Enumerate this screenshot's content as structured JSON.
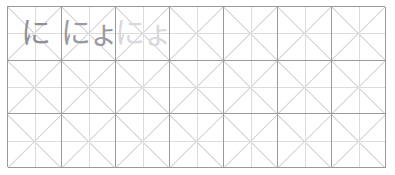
{
  "worksheet": {
    "title": "Japanese hiragana handwriting practice sheet",
    "script_type": "hiragana",
    "grid": {
      "columns": 7,
      "rows": 3,
      "cell_style": "diagonal-cross guide box",
      "border_color": "#9a9a9a",
      "diagonal_color": "#cfcfd4",
      "center_cross_color": "#dcdce0",
      "background_color": "#ffffff"
    },
    "ink_colors": {
      "dark": "#8f8f98",
      "mid": "#9a9aa4",
      "light": "#d8d8de"
    },
    "cells": [
      {
        "row": 1,
        "col": 1,
        "text": "に",
        "ink": "ink-dark",
        "filled": true
      },
      {
        "row": 1,
        "col": 2,
        "text": "にょ",
        "ink": "ink-mid",
        "filled": true
      },
      {
        "row": 1,
        "col": 3,
        "text": "にょ",
        "ink": "ink-light",
        "filled": true
      },
      {
        "row": 1,
        "col": 4,
        "text": "",
        "ink": "empty",
        "filled": false
      },
      {
        "row": 1,
        "col": 5,
        "text": "",
        "ink": "empty",
        "filled": false
      },
      {
        "row": 1,
        "col": 6,
        "text": "",
        "ink": "empty",
        "filled": false
      },
      {
        "row": 1,
        "col": 7,
        "text": "",
        "ink": "empty",
        "filled": false
      },
      {
        "row": 2,
        "col": 1,
        "text": "",
        "ink": "empty",
        "filled": false
      },
      {
        "row": 2,
        "col": 2,
        "text": "",
        "ink": "empty",
        "filled": false
      },
      {
        "row": 2,
        "col": 3,
        "text": "",
        "ink": "empty",
        "filled": false
      },
      {
        "row": 2,
        "col": 4,
        "text": "",
        "ink": "empty",
        "filled": false
      },
      {
        "row": 2,
        "col": 5,
        "text": "",
        "ink": "empty",
        "filled": false
      },
      {
        "row": 2,
        "col": 6,
        "text": "",
        "ink": "empty",
        "filled": false
      },
      {
        "row": 2,
        "col": 7,
        "text": "",
        "ink": "empty",
        "filled": false
      },
      {
        "row": 3,
        "col": 1,
        "text": "",
        "ink": "empty",
        "filled": false
      },
      {
        "row": 3,
        "col": 2,
        "text": "",
        "ink": "empty",
        "filled": false
      },
      {
        "row": 3,
        "col": 3,
        "text": "",
        "ink": "empty",
        "filled": false
      },
      {
        "row": 3,
        "col": 4,
        "text": "",
        "ink": "empty",
        "filled": false
      },
      {
        "row": 3,
        "col": 5,
        "text": "",
        "ink": "empty",
        "filled": false
      },
      {
        "row": 3,
        "col": 6,
        "text": "",
        "ink": "empty",
        "filled": false
      },
      {
        "row": 3,
        "col": 7,
        "text": "",
        "ink": "empty",
        "filled": false
      }
    ]
  }
}
